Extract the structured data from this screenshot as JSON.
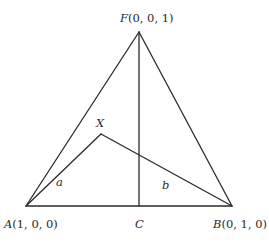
{
  "diagram": {
    "points": {
      "F": {
        "name": "F",
        "coords": "(0, 0, 1)",
        "x": 139,
        "y": 32
      },
      "A": {
        "name": "A",
        "coords": "(1, 0, 0)",
        "x": 26,
        "y": 206
      },
      "B": {
        "name": "B",
        "coords": "(0, 1, 0)",
        "x": 232,
        "y": 206
      },
      "C": {
        "name": "C",
        "x": 139,
        "y": 206
      },
      "X": {
        "name": "X",
        "x": 101,
        "y": 134
      }
    },
    "labels": {
      "F": "F",
      "F_coords": "(0, 0, 1)",
      "A": "A",
      "A_coords": "(1, 0, 0)",
      "B": "B",
      "B_coords": "(0, 1, 0)",
      "C": "C",
      "X": "X",
      "a": "a",
      "b": "b"
    },
    "colors": {
      "stroke": "#2a2a2a",
      "background": "#ffffff"
    }
  }
}
